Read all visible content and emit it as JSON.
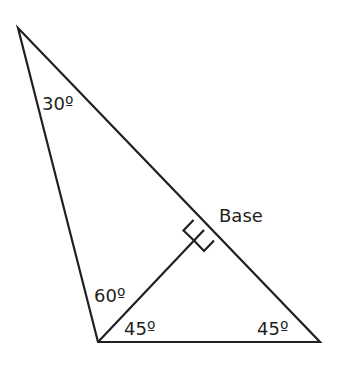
{
  "diagram": {
    "colors": {
      "stroke": "#231f20",
      "background": "#ffffff"
    },
    "vertices": {
      "top": [
        18,
        28
      ],
      "bottom_left": [
        98,
        342
      ],
      "bottom_right": [
        320,
        342
      ],
      "altitude_foot": [
        204,
        230
      ]
    },
    "labels": {
      "angle_top": "30º",
      "angle_left_upper": "60º",
      "angle_left_lower": "45º",
      "angle_right": "45º",
      "base": "Base"
    }
  }
}
